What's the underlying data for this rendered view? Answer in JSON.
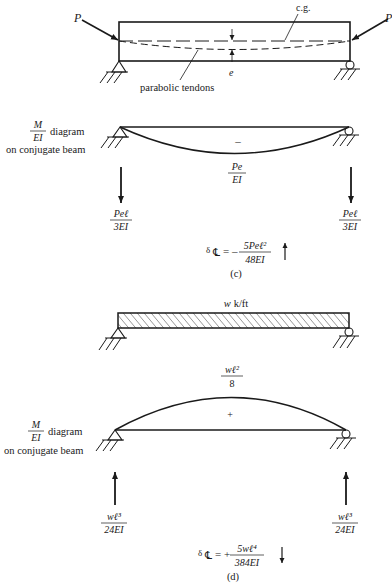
{
  "figure_c": {
    "caption": "(c)",
    "beam": {
      "load_left": "P",
      "load_right": "P",
      "cg_label": "c.g.",
      "eccentricity_label": "e",
      "tendon_label": "parabolic tendons"
    },
    "conjugate": {
      "label_fraction_num": "M",
      "label_fraction_den": "EI",
      "label_word": "diagram",
      "label_line2": "on conjugate beam",
      "sign": "–",
      "peak_num": "Pe",
      "peak_den": "EI",
      "reaction_left_num": "Peℓ",
      "reaction_left_den": "3EI",
      "reaction_right_num": "Peℓ",
      "reaction_right_den": "3EI",
      "reaction_direction": "down"
    },
    "deflection": {
      "symbol": "δ",
      "subscript": "℄",
      "sign": "= –",
      "num": "5Peℓ²",
      "den": "48EI",
      "arrow": "up"
    }
  },
  "figure_d": {
    "caption": "(d)",
    "beam": {
      "load_label": "w k/ft"
    },
    "conjugate": {
      "label_fraction_num": "M",
      "label_fraction_den": "EI",
      "label_word": "diagram",
      "label_line2": "on conjugate beam",
      "sign": "+",
      "peak_num": "wℓ²",
      "peak_den": "8",
      "reaction_left_num": "wℓ³",
      "reaction_left_den": "24EI",
      "reaction_right_num": "wℓ³",
      "reaction_right_den": "24EI",
      "reaction_direction": "up"
    },
    "deflection": {
      "symbol": "δ",
      "subscript": "℄",
      "sign": "= +",
      "num": "5wℓ⁴",
      "den": "384EI",
      "arrow": "down"
    }
  }
}
